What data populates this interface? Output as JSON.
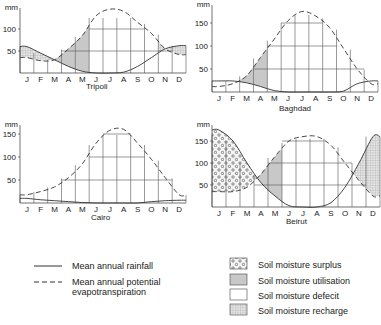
{
  "chart_data": [
    {
      "type": "line",
      "title": "Tripoli",
      "ylabel": "mm",
      "categories": [
        "J",
        "F",
        "M",
        "A",
        "M",
        "J",
        "J",
        "A",
        "S",
        "O",
        "N",
        "D"
      ],
      "yticks": [
        50,
        100
      ],
      "ylim": [
        0,
        150
      ],
      "series": [
        {
          "name": "Mean annual rainfall",
          "style": "solid",
          "values": [
            60,
            45,
            30,
            15,
            4,
            0,
            0,
            2,
            15,
            35,
            55,
            62
          ]
        },
        {
          "name": "Mean annual potential evapotranspiration",
          "style": "dashed",
          "values": [
            35,
            28,
            30,
            55,
            85,
            130,
            145,
            140,
            115,
            90,
            55,
            42
          ]
        }
      ],
      "zones": [
        {
          "type": "Soil moisture surplus",
          "months": [
            "J",
            "D"
          ]
        },
        {
          "type": "Soil moisture recharge",
          "months": [
            "J",
            "F",
            "N",
            "D"
          ]
        },
        {
          "type": "Soil moisture utilisation",
          "months": [
            "M",
            "A",
            "M"
          ]
        },
        {
          "type": "Soil moisture defecit",
          "months": [
            "J",
            "J",
            "A",
            "S",
            "O"
          ]
        }
      ]
    },
    {
      "type": "line",
      "title": "Baghdad",
      "ylabel": "mm",
      "categories": [
        "J",
        "F",
        "M",
        "A",
        "M",
        "J",
        "J",
        "A",
        "S",
        "O",
        "N",
        "D"
      ],
      "yticks": [
        50,
        100,
        150
      ],
      "ylim": [
        0,
        180
      ],
      "series": [
        {
          "name": "Mean annual rainfall",
          "style": "solid",
          "values": [
            24,
            24,
            20,
            12,
            3,
            0,
            0,
            0,
            0,
            2,
            18,
            24
          ]
        },
        {
          "name": "Mean annual potential evapotranspiration",
          "style": "dashed",
          "values": [
            12,
            18,
            35,
            75,
            115,
            155,
            175,
            165,
            140,
            95,
            50,
            18
          ]
        }
      ],
      "zones": [
        {
          "type": "Soil moisture utilisation",
          "months": [
            "M",
            "A"
          ]
        },
        {
          "type": "Soil moisture defecit",
          "months": [
            "M",
            "J",
            "J",
            "A",
            "S",
            "O",
            "N"
          ]
        }
      ]
    },
    {
      "type": "line",
      "title": "Cairo",
      "ylabel": "mm",
      "categories": [
        "J",
        "F",
        "M",
        "A",
        "M",
        "J",
        "J",
        "A",
        "S",
        "O",
        "N",
        "D"
      ],
      "yticks": [
        50,
        100,
        150
      ],
      "ylim": [
        0,
        180
      ],
      "series": [
        {
          "name": "Mean annual rainfall",
          "style": "solid",
          "values": [
            10,
            7,
            5,
            3,
            1,
            0,
            0,
            0,
            0,
            3,
            5,
            6
          ]
        },
        {
          "name": "Mean annual potential evapotranspiration",
          "style": "dashed",
          "values": [
            18,
            25,
            35,
            55,
            85,
            130,
            158,
            160,
            130,
            95,
            55,
            18
          ]
        }
      ],
      "zones": [
        {
          "type": "Soil moisture defecit",
          "months": [
            "J",
            "F",
            "M",
            "A",
            "M",
            "J",
            "J",
            "A",
            "S",
            "O",
            "N",
            "D"
          ]
        }
      ]
    },
    {
      "type": "line",
      "title": "Beirut",
      "ylabel": "mm",
      "categories": [
        "J",
        "F",
        "M",
        "A",
        "M",
        "J",
        "J",
        "A",
        "S",
        "O",
        "N",
        "D"
      ],
      "yticks": [
        50,
        100,
        150
      ],
      "ylim": [
        0,
        180
      ],
      "series": [
        {
          "name": "Mean annual rainfall",
          "style": "solid",
          "values": [
            175,
            150,
            100,
            55,
            25,
            3,
            0,
            0,
            10,
            45,
            100,
            160
          ]
        },
        {
          "name": "Mean annual potential evapotranspiration",
          "style": "dashed",
          "values": [
            35,
            35,
            45,
            75,
            115,
            150,
            160,
            160,
            140,
            100,
            60,
            25
          ]
        }
      ],
      "zones": [
        {
          "type": "Soil moisture surplus",
          "months": [
            "J",
            "F",
            "M"
          ]
        },
        {
          "type": "Soil moisture utilisation",
          "months": [
            "A",
            "M"
          ]
        },
        {
          "type": "Soil moisture defecit",
          "months": [
            "J",
            "J",
            "A",
            "S",
            "O"
          ]
        },
        {
          "type": "Soil moisture recharge",
          "months": [
            "N",
            "D"
          ]
        }
      ]
    }
  ],
  "legend": {
    "lines": [
      {
        "label": "Mean annual rainfall",
        "style": "solid"
      },
      {
        "label": "Mean annual potential evapotranspiration",
        "line1": "Mean annual potential",
        "line2": "evapotranspiration",
        "style": "dashed"
      }
    ],
    "fills": [
      {
        "label": "Soil moisture surplus",
        "pattern": "dots"
      },
      {
        "label": "Soil moisture utilisation",
        "pattern": "grey"
      },
      {
        "label": "Soil moisture defecit",
        "pattern": "blank"
      },
      {
        "label": "Soil moisture recharge",
        "pattern": "grid"
      }
    ]
  },
  "colors": {
    "line": "#333333",
    "utilisation": "#c8c8c8",
    "grid": "#555555"
  }
}
